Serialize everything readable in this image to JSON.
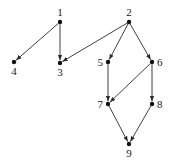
{
  "diagram": {
    "type": "directed-graph",
    "nodes": [
      {
        "id": "1",
        "label": "1",
        "x": 60,
        "y": 22,
        "label_pos": "above"
      },
      {
        "id": "2",
        "label": "2",
        "x": 129,
        "y": 22,
        "label_pos": "above"
      },
      {
        "id": "3",
        "label": "3",
        "x": 60,
        "y": 63,
        "label_pos": "below"
      },
      {
        "id": "4",
        "label": "4",
        "x": 14,
        "y": 62,
        "label_pos": "below"
      },
      {
        "id": "5",
        "label": "5",
        "x": 108,
        "y": 62,
        "label_pos": "left"
      },
      {
        "id": "6",
        "label": "6",
        "x": 152,
        "y": 62,
        "label_pos": "right"
      },
      {
        "id": "7",
        "label": "7",
        "x": 108,
        "y": 104,
        "label_pos": "left"
      },
      {
        "id": "8",
        "label": "8",
        "x": 152,
        "y": 104,
        "label_pos": "right"
      },
      {
        "id": "9",
        "label": "9",
        "x": 129,
        "y": 144,
        "label_pos": "below"
      }
    ],
    "edges": [
      {
        "from": "1",
        "to": "4"
      },
      {
        "from": "1",
        "to": "3"
      },
      {
        "from": "2",
        "to": "3"
      },
      {
        "from": "2",
        "to": "5"
      },
      {
        "from": "2",
        "to": "6"
      },
      {
        "from": "5",
        "to": "7"
      },
      {
        "from": "6",
        "to": "7"
      },
      {
        "from": "6",
        "to": "8"
      },
      {
        "from": "7",
        "to": "9"
      },
      {
        "from": "8",
        "to": "9"
      }
    ],
    "colors": {
      "edge": "#2a2a2a",
      "node": "#111111",
      "background": "#ffffff"
    }
  }
}
